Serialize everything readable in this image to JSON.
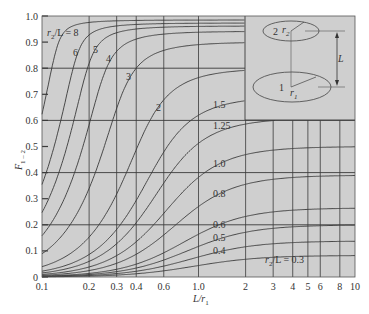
{
  "chart_data": {
    "type": "line",
    "title": "",
    "xlabel": "L/r1",
    "ylabel": "F1-2",
    "xscale": "log",
    "xlim": [
      0.1,
      10
    ],
    "ylim": [
      0,
      1.0
    ],
    "grid": true,
    "x_ticks": [
      0.1,
      0.2,
      0.3,
      0.4,
      0.6,
      1.0,
      2,
      3,
      4,
      5,
      6,
      8,
      10
    ],
    "x_tick_labels": [
      "0.1",
      "0.2",
      "0.3",
      "0.4",
      "0.6",
      "1.0",
      "2",
      "3",
      "4",
      "5",
      "6",
      "8",
      "10"
    ],
    "y_ticks": [
      0,
      0.1,
      0.2,
      0.3,
      0.4,
      0.5,
      0.6,
      0.7,
      0.8,
      0.9,
      1.0
    ],
    "y_tick_labels": [
      "0",
      "0.1",
      "0.2",
      "0.3",
      "0.4",
      "0.5",
      "0.6",
      "0.7",
      "0.8",
      "0.9",
      "1.0"
    ],
    "parameter": "r2/L",
    "series": [
      {
        "name": "r2/L = 8",
        "r2_over_L": 8,
        "label": "r2/L = 8"
      },
      {
        "name": "6",
        "r2_over_L": 6,
        "label": "6"
      },
      {
        "name": "5",
        "r2_over_L": 5,
        "label": "5"
      },
      {
        "name": "4",
        "r2_over_L": 4,
        "label": "4"
      },
      {
        "name": "3",
        "r2_over_L": 3,
        "label": "3"
      },
      {
        "name": "2",
        "r2_over_L": 2,
        "label": "2"
      },
      {
        "name": "1.5",
        "r2_over_L": 1.5,
        "label": "1.5"
      },
      {
        "name": "1.25",
        "r2_over_L": 1.25,
        "label": "1.25"
      },
      {
        "name": "1.0",
        "r2_over_L": 1.0,
        "label": "1.0"
      },
      {
        "name": "0.8",
        "r2_over_L": 0.8,
        "label": "0.8"
      },
      {
        "name": "0.6",
        "r2_over_L": 0.6,
        "label": "0.6"
      },
      {
        "name": "0.5",
        "r2_over_L": 0.5,
        "label": "0.5"
      },
      {
        "name": "0.4",
        "r2_over_L": 0.4,
        "label": "0.4"
      },
      {
        "name": "0.3",
        "r2_over_L": 0.3,
        "label": "r2/L = 0.3"
      }
    ],
    "sample_values": {
      "x": [
        0.1,
        0.2,
        0.4,
        1.0,
        2,
        4,
        10
      ],
      "r2/L=8": [
        0.64,
        0.97,
        0.99,
        0.99,
        0.99,
        0.99,
        0.99
      ],
      "r2/L=3": [
        0.08,
        0.31,
        0.79,
        0.9,
        0.9,
        0.9,
        0.9
      ],
      "r2/L=1.0": [
        0.01,
        0.04,
        0.14,
        0.38,
        0.49,
        0.5,
        0.5
      ],
      "r2/L=0.3": [
        0.001,
        0.004,
        0.015,
        0.05,
        0.08,
        0.08,
        0.08
      ]
    },
    "inset": {
      "description": "Coaxial parallel disks: disk 2 radius r2 above disk 1 radius r1, separated by distance L",
      "labels": [
        "2",
        "r2",
        "1",
        "r1",
        "L"
      ]
    }
  },
  "axes": {
    "xlabel_main": "L/r",
    "xlabel_sub": "1",
    "ylabel_main": "F",
    "ylabel_sub": "1 – 2"
  },
  "labels": {
    "r8_prefix": "r",
    "r8_sub": "2",
    "r8_suffix": "/L = 8",
    "r03_prefix": "r",
    "r03_sub": "2",
    "r03_suffix": "/L = 0.3",
    "inset_disk2": "2",
    "inset_r2": "r",
    "inset_r2_sub": "2",
    "inset_disk1": "1",
    "inset_r1": "r",
    "inset_r1_sub": "1",
    "inset_L": "L"
  },
  "colors": {
    "plot_bg": "#cfcfcf",
    "grid": "#3a3a3a",
    "curve": "#3a3a3a",
    "text": "#333333"
  }
}
